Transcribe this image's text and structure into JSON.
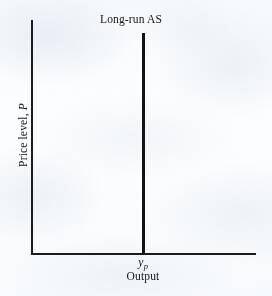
{
  "figure": {
    "background_color": "#fcfdfe",
    "ink_color": "#1b1b1b",
    "width": 272,
    "height": 296
  },
  "chart_data": {
    "type": "line",
    "title": "",
    "xlabel": "Output",
    "ylabel": "Price level, P",
    "grid": false,
    "legend": null,
    "xlim": [
      0,
      1
    ],
    "ylim": [
      0,
      1
    ],
    "xticks": [
      {
        "value": 0.5,
        "label_symbol": "y",
        "label_subscript": "p",
        "label": "yp"
      }
    ],
    "yticks": [],
    "series": [
      {
        "name": "Long-run AS",
        "kind": "vertical-line",
        "annotation": "Long-run AS",
        "x": [
          0.5,
          0.5
        ],
        "y": [
          0.0,
          1.0
        ],
        "color": "#131313",
        "linewidth": 3
      }
    ],
    "annotations": [
      {
        "text": "Long-run AS",
        "x": 0.5,
        "y": 1.06,
        "anchor": "top-center"
      }
    ]
  },
  "labels": {
    "curve": "Long-run AS",
    "y_axis_text": "Price level, ",
    "y_axis_symbol": "P",
    "x_axis": "Output",
    "x_tick_symbol": "y",
    "x_tick_subscript": "p"
  }
}
